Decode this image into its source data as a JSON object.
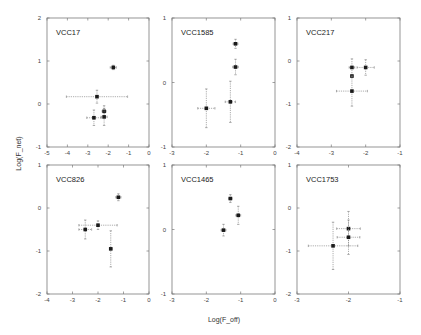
{
  "figure": {
    "xlabel": "Log(F_off)",
    "ylabel": "Log(F_net)"
  },
  "chart_data": [
    {
      "type": "scatter",
      "title": "VCC17",
      "xlabel": "Log(F_off)",
      "ylabel": "Log(F_net)",
      "xlim": [
        -5,
        0
      ],
      "ylim": [
        -1,
        2
      ],
      "xticks": [
        -5,
        -4,
        -3,
        -2,
        -1,
        0
      ],
      "yticks": [
        -1,
        0,
        1,
        2
      ],
      "points": [
        {
          "x": -1.75,
          "y": 0.85,
          "xerr": 0.15,
          "yerr": 0.05
        },
        {
          "x": -2.55,
          "y": 0.17,
          "xerr": 1.5,
          "yerr": 0.15
        },
        {
          "x": -2.2,
          "y": -0.17,
          "xerr": 0.1,
          "yerr": 0.13
        },
        {
          "x": -2.7,
          "y": -0.32,
          "xerr": 0.35,
          "yerr": 0.18
        },
        {
          "x": -2.2,
          "y": -0.3,
          "xerr": 0.15,
          "yerr": 0.2
        }
      ]
    },
    {
      "type": "scatter",
      "title": "VCC1585",
      "xlabel": "Log(F_off)",
      "ylabel": "Log(F_net)",
      "xlim": [
        -3,
        0
      ],
      "ylim": [
        -1,
        1
      ],
      "xticks": [
        -3,
        -2,
        -1,
        0
      ],
      "yticks": [
        -1,
        0,
        1
      ],
      "points": [
        {
          "x": -1.15,
          "y": 0.6,
          "xerr": 0.07,
          "yerr": 0.07
        },
        {
          "x": -1.15,
          "y": 0.24,
          "xerr": 0.08,
          "yerr": 0.12
        },
        {
          "x": -1.3,
          "y": -0.3,
          "xerr": 0.15,
          "yerr": 0.32
        },
        {
          "x": -2.0,
          "y": -0.4,
          "xerr": 0.25,
          "yerr": 0.3
        }
      ]
    },
    {
      "type": "scatter",
      "title": "VCC217",
      "xlabel": "Log(F_off)",
      "ylabel": "Log(F_net)",
      "xlim": [
        -4,
        -1
      ],
      "ylim": [
        -2,
        1
      ],
      "xticks": [
        -4,
        -3,
        -2,
        -1
      ],
      "yticks": [
        -2,
        -1,
        0,
        1
      ],
      "points": [
        {
          "x": -2.4,
          "y": -0.15,
          "xerr": 0.08,
          "yerr": 0.2
        },
        {
          "x": -2.0,
          "y": -0.15,
          "xerr": 0.25,
          "yerr": 0.18
        },
        {
          "x": -2.4,
          "y": -0.35,
          "xerr": 0.02,
          "yerr": 0.02
        },
        {
          "x": -2.4,
          "y": -0.7,
          "xerr": 0.45,
          "yerr": 0.35
        }
      ]
    },
    {
      "type": "scatter",
      "title": "VCC826",
      "xlabel": "Log(F_off)",
      "ylabel": "Log(F_net)",
      "xlim": [
        -4,
        0
      ],
      "ylim": [
        -2,
        1
      ],
      "xticks": [
        -4,
        -3,
        -2,
        -1,
        0
      ],
      "yticks": [
        -2,
        -1,
        0,
        1
      ],
      "points": [
        {
          "x": -1.2,
          "y": 0.25,
          "xerr": 0.1,
          "yerr": 0.08
        },
        {
          "x": -2.0,
          "y": -0.4,
          "xerr": 0.75,
          "yerr": 0.1
        },
        {
          "x": -2.5,
          "y": -0.5,
          "xerr": 0.25,
          "yerr": 0.22
        },
        {
          "x": -1.5,
          "y": -0.95,
          "xerr": 0.05,
          "yerr": 0.42
        }
      ]
    },
    {
      "type": "scatter",
      "title": "VCC1465",
      "xlabel": "Log(F_off)",
      "ylabel": "Log(F_net)",
      "xlim": [
        -3,
        0
      ],
      "ylim": [
        -1,
        1
      ],
      "xticks": [
        -3,
        -2,
        -1,
        0
      ],
      "yticks": [
        -1,
        0,
        1
      ],
      "points": [
        {
          "x": -1.3,
          "y": 0.48,
          "xerr": 0.05,
          "yerr": 0.06
        },
        {
          "x": -1.07,
          "y": 0.22,
          "xerr": 0.07,
          "yerr": 0.14
        },
        {
          "x": -1.5,
          "y": -0.01,
          "xerr": 0.07,
          "yerr": 0.09
        }
      ]
    },
    {
      "type": "scatter",
      "title": "VCC1753",
      "xlabel": "Log(F_off)",
      "ylabel": "Log(F_net)",
      "xlim": [
        -3,
        -1
      ],
      "ylim": [
        -2,
        1
      ],
      "xticks": [
        -3,
        -2,
        -1
      ],
      "yticks": [
        -2,
        -1,
        0,
        1
      ],
      "points": [
        {
          "x": -2.0,
          "y": -0.48,
          "xerr": 0.23,
          "yerr": 0.4
        },
        {
          "x": -2.0,
          "y": -0.68,
          "xerr": 0.22,
          "yerr": 0.4
        },
        {
          "x": -2.3,
          "y": -0.88,
          "xerr": 0.48,
          "yerr": 0.55
        }
      ]
    }
  ]
}
